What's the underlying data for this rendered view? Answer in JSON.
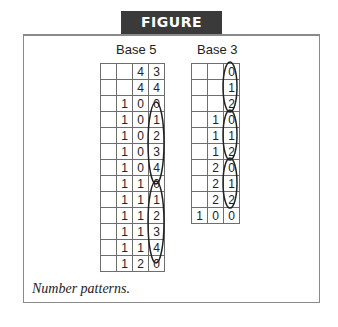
{
  "banner": {
    "label": "FIGURE 9.10"
  },
  "base5": {
    "title": "Base 5",
    "rows": [
      [
        "",
        "",
        "4",
        "3"
      ],
      [
        "",
        "",
        "4",
        "4"
      ],
      [
        "",
        "1",
        "0",
        "0"
      ],
      [
        "",
        "1",
        "0",
        "1"
      ],
      [
        "",
        "1",
        "0",
        "2"
      ],
      [
        "",
        "1",
        "0",
        "3"
      ],
      [
        "",
        "1",
        "0",
        "4"
      ],
      [
        "",
        "1",
        "1",
        "0"
      ],
      [
        "",
        "1",
        "1",
        "1"
      ],
      [
        "",
        "1",
        "1",
        "2"
      ],
      [
        "",
        "1",
        "1",
        "3"
      ],
      [
        "",
        "1",
        "1",
        "4"
      ],
      [
        "",
        "1",
        "2",
        "0"
      ]
    ]
  },
  "base3": {
    "title": "Base 3",
    "rows": [
      [
        "",
        "",
        "0"
      ],
      [
        "",
        "",
        "1"
      ],
      [
        "",
        "",
        "2"
      ],
      [
        "",
        "1",
        "0"
      ],
      [
        "",
        "1",
        "1"
      ],
      [
        "",
        "1",
        "2"
      ],
      [
        "",
        "2",
        "0"
      ],
      [
        "",
        "2",
        "1"
      ],
      [
        "",
        "2",
        "2"
      ],
      [
        "1",
        "0",
        "0"
      ]
    ]
  },
  "caption": "Number patterns."
}
